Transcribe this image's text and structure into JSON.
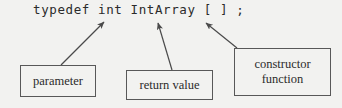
{
  "figure": {
    "type": "annotated-code-diagram",
    "background_color": "#f2f2f0",
    "line_color": "#585858",
    "text_color": "#2b2b2b"
  },
  "code": {
    "text": "typedef int IntArray [ ] ;",
    "tokens": [
      "typedef",
      "int",
      "IntArray",
      "[",
      "]",
      ";"
    ]
  },
  "annotations": [
    {
      "id": "parameter",
      "label": "parameter",
      "lines": [
        "parameter"
      ],
      "points_to": "IntArray"
    },
    {
      "id": "return-value",
      "label": "return value",
      "lines": [
        "return value"
      ],
      "points_to": "int"
    },
    {
      "id": "constructor-function",
      "label": "constructor function",
      "lines": [
        "constructor",
        "function"
      ],
      "points_to": "[ ]"
    }
  ],
  "arrows": [
    {
      "id": "arrow-parameter",
      "from": "parameter-box",
      "to": "IntArray",
      "x1": 61,
      "y1": 65,
      "x2": 104,
      "y2": 22
    },
    {
      "id": "arrow-return-value",
      "from": "return-value-box",
      "to": "int",
      "x1": 172,
      "y1": 70,
      "x2": 158,
      "y2": 23
    },
    {
      "id": "arrow-constructor-function",
      "from": "constructor-function-box",
      "to": "brackets",
      "x1": 237,
      "y1": 48,
      "x2": 206,
      "y2": 23
    }
  ]
}
